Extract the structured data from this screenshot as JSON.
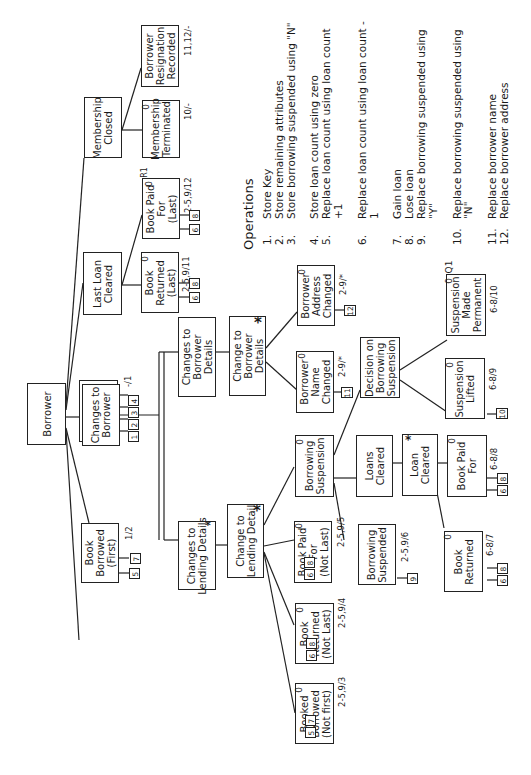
{
  "diagram": {
    "root": "Borrower",
    "nodes": {
      "borrower": "Borrower",
      "borrower_registered": "Borrower\nRegistered",
      "book_borrowed_first": "Book\nBorrowed\n(First)",
      "changes_to_borrower": "Changes to\nBorrower",
      "last_loan_cleared": "Last Loan\nCleared",
      "membership_closed": "Membership\nClosed",
      "book_returned_last": "Book\nReturned\n(Last)",
      "book_paid_for_last": "Book Paid\nFor\n(Last)",
      "membership_terminated": "Membership\nTerminated",
      "borrower_resignation_recorded": "Borrower\nResignation\nRecorded",
      "changes_to_borrower_details": "Changes to\nBorrower\nDetails",
      "change_to_borrower_details": "Change to\nBorrower\nDetails",
      "borrower_name_changed": "Borrower\nName\nChanged",
      "borrower_address_changed": "Borrower\nAddress\nChanged",
      "changes_to_lending_details": "Changes to\nLending Details",
      "change_to_lending_detail": "Change to\nLending Detail",
      "booked_borrowed_not_first": "Booked\nBorrowed\n(Not first)",
      "book_returned_not_last": "Book\nReturned\n(Not Last)",
      "book_paid_for_not_last": "Book Paid\nFor\n(Not Last)",
      "borrowing_suspension": "Borrowing\nSuspension",
      "borrowing_suspended": "Borrowing\nSuspended",
      "decision_on_borrowing_suspension": "Decision on\nBorrowing\nSuspension",
      "suspension_lifted": "Suspension\nLifted",
      "suspension_made_permanent": "Suspension\nMade\nPermanent",
      "loans_cleared": "Loans\nCleared",
      "loan_cleared": "Loan\nCleared",
      "book_paid_for": "Book Paid\nFor",
      "book_returned": "Book\nReturned"
    },
    "state_labels": {
      "borrower_registered": "-/1",
      "book_borrowed_first": "1/2",
      "book_returned_last": "2-5,9/11",
      "book_paid_for_last": "2-5,9/12",
      "membership_terminated": "10/-",
      "borrower_resignation_recorded": "11,12/-",
      "borrower_name_changed": "2-9/*",
      "borrower_address_changed": "2-9/*",
      "booked_borrowed_not_first": "2-5,9/3",
      "book_returned_not_last": "2-5,9/4",
      "book_paid_for_not_last": "2-5,9/5",
      "borrowing_suspended": "2-5,9/6",
      "suspension_lifted": "6-8/9",
      "suspension_made_permanent": "6-8/10",
      "book_paid_for": "6-8/8",
      "book_returned": "6-8/7"
    },
    "markers": {
      "selection": "0",
      "iteration": "*",
      "resume": "R1",
      "quit": "Q1"
    },
    "op_refs": {
      "borrower_registered": [
        "1",
        "2",
        "3",
        "4"
      ],
      "book_borrowed_first": [
        "5",
        "7"
      ],
      "book_returned_last": [
        "6",
        "8"
      ],
      "book_paid_for_last": [
        "6",
        "8"
      ],
      "borrower_name_changed": [
        "11"
      ],
      "borrower_address_changed": [
        "12"
      ],
      "booked_borrowed_not_first": [
        "5",
        "7"
      ],
      "book_returned_not_last": [
        "6",
        "8"
      ],
      "book_paid_for_not_last": [
        "6",
        "8"
      ],
      "borrowing_suspended": [
        "9"
      ],
      "suspension_lifted": [
        "10"
      ],
      "book_paid_for": [
        "6",
        "8"
      ],
      "book_returned": [
        "6",
        "8"
      ]
    }
  },
  "operations": {
    "title": "Operations",
    "items": [
      {
        "num": "1.",
        "text": "Store Key"
      },
      {
        "num": "2.",
        "text": "Store remaining attributes"
      },
      {
        "num": "3.",
        "text": "Store borrowing suspended using \"N\""
      },
      {
        "num": "4.",
        "text": "Store loan count using zero"
      },
      {
        "num": "5.",
        "text": "Replace loan count using loan count +1"
      },
      {
        "num": "6.",
        "text": "Replace loan count using loan count - 1"
      },
      {
        "num": "7.",
        "text": "Gain loan"
      },
      {
        "num": "8.",
        "text": "Lose loan"
      },
      {
        "num": "9.",
        "text": "Replace borrowing suspended using \"Y\""
      },
      {
        "num": "10.",
        "text": "Replace borrowing suspended using \"N\""
      },
      {
        "num": "11.",
        "text": "Replace borrower name"
      },
      {
        "num": "12.",
        "text": "Replace borrower address"
      }
    ]
  }
}
